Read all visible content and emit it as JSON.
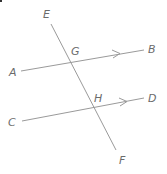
{
  "diagram": {
    "colors": {
      "line": "#9a9a9a",
      "label": "#6b6b6b",
      "background": "#ffffff"
    },
    "points": {
      "A": {
        "label": "A",
        "x": 9,
        "y": 76
      },
      "B": {
        "label": "B",
        "x": 148,
        "y": 53
      },
      "C": {
        "label": "C",
        "x": 8,
        "y": 126
      },
      "D": {
        "label": "D",
        "x": 148,
        "y": 102
      },
      "E": {
        "label": "E",
        "x": 43,
        "y": 18
      },
      "F": {
        "label": "F",
        "x": 119,
        "y": 164
      },
      "G": {
        "label": "G",
        "x": 71,
        "y": 55
      },
      "H": {
        "label": "H",
        "x": 94,
        "y": 102
      }
    },
    "lines": {
      "AB": {
        "x1": 21,
        "y1": 71,
        "x2": 144,
        "y2": 50,
        "arrow": {
          "x": 118,
          "y": 54
        }
      },
      "CD": {
        "x1": 22,
        "y1": 121,
        "x2": 144,
        "y2": 98,
        "arrow": {
          "x": 125,
          "y": 102
        }
      },
      "EF": {
        "x1": 51,
        "y1": 24,
        "x2": 116,
        "y2": 150
      }
    },
    "intersections": [
      {
        "name": "G",
        "x": 70,
        "y": 62
      },
      {
        "name": "H",
        "x": 95,
        "y": 108
      }
    ]
  }
}
